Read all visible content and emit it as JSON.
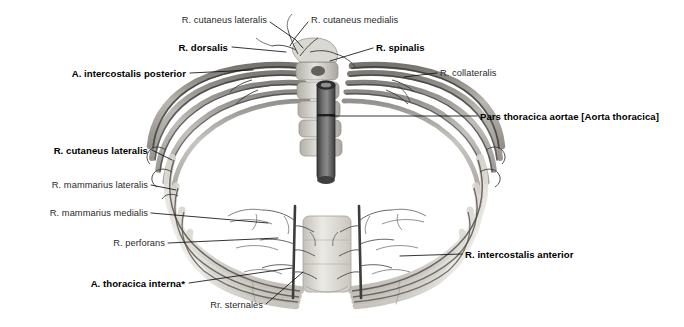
{
  "figure": {
    "width": 684,
    "height": 327,
    "background": "#ffffff",
    "line_color": "#1a1a1a",
    "bone_light": "#e9e7e2",
    "bone_mid": "#c9c6bf",
    "bone_dark": "#8e8b85",
    "vessel_dark": "#4a4a4a",
    "aorta_color": "#545454"
  },
  "labels": [
    {
      "id": "r-cutaneus-lateralis-top",
      "text": "R. cutaneus lateralis",
      "bold": false,
      "x": 267,
      "y": 20,
      "align": "end",
      "leader": [
        [
          270,
          22
        ],
        [
          296,
          40
        ],
        [
          303,
          48
        ]
      ]
    },
    {
      "id": "r-cutaneus-medialis",
      "text": "R. cutaneus medialis",
      "bold": false,
      "x": 311,
      "y": 20,
      "align": "start",
      "leader": [
        [
          308,
          22
        ],
        [
          295,
          38
        ],
        [
          290,
          46
        ]
      ]
    },
    {
      "id": "r-dorsalis",
      "text": "R. dorsalis",
      "bold": true,
      "x": 228,
      "y": 47,
      "align": "end",
      "leader": [
        [
          232,
          47
        ],
        [
          286,
          52
        ]
      ]
    },
    {
      "id": "r-spinalis",
      "text": "R. spinalis",
      "bold": true,
      "x": 376,
      "y": 47,
      "align": "start",
      "leader": [
        [
          373,
          48
        ],
        [
          330,
          61
        ]
      ]
    },
    {
      "id": "a-intercostalis-posterior",
      "text": "A. intercostalis posterior",
      "bold": true,
      "x": 186,
      "y": 73,
      "align": "end",
      "leader": [
        [
          190,
          73
        ],
        [
          253,
          70
        ]
      ]
    },
    {
      "id": "r-collateralis",
      "text": "R. collateralis",
      "bold": false,
      "x": 440,
      "y": 73,
      "align": "start",
      "leader": [
        [
          437,
          73
        ],
        [
          404,
          77
        ]
      ]
    },
    {
      "id": "pars-thoracica-aortae",
      "text": "Pars thoracica aortae [Aorta thoracica]",
      "bold": true,
      "x": 480,
      "y": 116,
      "align": "start",
      "leader": [
        [
          477,
          116
        ],
        [
          331,
          116
        ]
      ]
    },
    {
      "id": "r-cutaneus-lateralis-left",
      "text": "R. cutaneus lateralis",
      "bold": true,
      "x": 148,
      "y": 150,
      "align": "end",
      "leader": [
        [
          152,
          150
        ],
        [
          172,
          160
        ]
      ]
    },
    {
      "id": "r-mammarius-lateralis",
      "text": "R. mammarius lateralis",
      "bold": false,
      "x": 148,
      "y": 185,
      "align": "end",
      "leader": [
        [
          151,
          185
        ],
        [
          176,
          190
        ]
      ]
    },
    {
      "id": "r-mammarius-medialis",
      "text": "R. mammarius medialis",
      "bold": false,
      "x": 148,
      "y": 213,
      "align": "end",
      "leader": [
        [
          151,
          213
        ],
        [
          268,
          223
        ]
      ]
    },
    {
      "id": "r-perforans",
      "text": "R. perforans",
      "bold": false,
      "x": 165,
      "y": 243,
      "align": "end",
      "leader": [
        [
          168,
          243
        ],
        [
          278,
          238
        ]
      ]
    },
    {
      "id": "a-thoracica-interna",
      "text": "A. thoracica interna*",
      "bold": true,
      "x": 185,
      "y": 283,
      "align": "end",
      "leader": [
        [
          189,
          283
        ],
        [
          292,
          268
        ]
      ]
    },
    {
      "id": "rr-sternales",
      "text": "Rr. sternales",
      "bold": false,
      "x": 263,
      "y": 305,
      "align": "end",
      "leader": [
        [
          266,
          304
        ],
        [
          303,
          272
        ]
      ]
    },
    {
      "id": "r-intercostalis-anterior",
      "text": "R. intercostalis anterior",
      "bold": true,
      "x": 465,
      "y": 254,
      "align": "start",
      "leader": [
        [
          462,
          254
        ],
        [
          400,
          256
        ]
      ]
    }
  ],
  "anatomy": {
    "aorta_label": "thoracic-aorta",
    "sternum_label": "sternum",
    "vertebrae_label": "thoracic-vertebrae",
    "rib_count": 8
  }
}
